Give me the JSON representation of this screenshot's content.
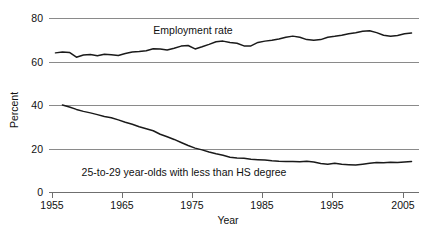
{
  "chart_data": {
    "type": "line",
    "title": "",
    "xlabel": "Year",
    "ylabel": "Percent",
    "xlim": [
      1954,
      2007
    ],
    "ylim": [
      0,
      84
    ],
    "grid": true,
    "legend_position": "inline-annotations",
    "xticks": [
      1955,
      1965,
      1975,
      1985,
      1995,
      2005
    ],
    "xticklabels": [
      "1955",
      "1965",
      "1975",
      "1985",
      "1995",
      "2005"
    ],
    "yticks": [
      0,
      20,
      40,
      60,
      80
    ],
    "yticklabels": [
      "0",
      "20",
      "40",
      "60",
      "80"
    ],
    "annotations": [
      {
        "text": "Employment rate",
        "x": 1982,
        "y": 78.5
      },
      {
        "text": "25-to-29 year-olds with less than HS degree",
        "x": 1984,
        "y": 8.5
      }
    ],
    "series": [
      {
        "name": "Employment rate",
        "color": "#1a1a1a",
        "x": [
          1955,
          1956,
          1957,
          1958,
          1959,
          1960,
          1961,
          1962,
          1963,
          1964,
          1965,
          1966,
          1967,
          1968,
          1969,
          1970,
          1971,
          1972,
          1973,
          1974,
          1975,
          1976,
          1977,
          1978,
          1979,
          1980,
          1981,
          1982,
          1983,
          1984,
          1985,
          1986,
          1987,
          1988,
          1989,
          1990,
          1991,
          1992,
          1993,
          1994,
          1995,
          1996,
          1997,
          1998,
          1999,
          2000,
          2001,
          2002,
          2003,
          2004,
          2005,
          2006
        ],
        "values": [
          64.2,
          64.6,
          64.4,
          62.2,
          63.2,
          63.4,
          62.9,
          63.6,
          63.3,
          63.0,
          63.9,
          64.6,
          64.8,
          65.2,
          66.1,
          66.0,
          65.5,
          66.3,
          67.3,
          67.6,
          66.0,
          67.0,
          68.1,
          69.3,
          69.6,
          69.0,
          68.6,
          67.4,
          67.4,
          69.0,
          69.6,
          70.0,
          70.6,
          71.4,
          71.9,
          71.4,
          70.3,
          70.0,
          70.3,
          71.4,
          71.8,
          72.3,
          73.0,
          73.4,
          74.1,
          74.4,
          73.5,
          72.3,
          71.8,
          72.2,
          73.0,
          73.3
        ],
        "values_note": "employment rate in percent; rescaled series as plotted spans roughly 62 to 76"
      },
      {
        "name": "25-to-29 year-olds with less than HS degree",
        "color": "#1a1a1a",
        "x": [
          1956,
          1957,
          1958,
          1959,
          1960,
          1961,
          1962,
          1963,
          1964,
          1965,
          1966,
          1967,
          1968,
          1969,
          1970,
          1971,
          1972,
          1973,
          1974,
          1975,
          1976,
          1977,
          1978,
          1979,
          1980,
          1981,
          1982,
          1983,
          1984,
          1985,
          1986,
          1987,
          1988,
          1989,
          1990,
          1991,
          1992,
          1993,
          1994,
          1995,
          1996,
          1997,
          1998,
          1999,
          2000,
          2001,
          2002,
          2003,
          2004,
          2005,
          2006
        ],
        "values": [
          40.2,
          39.3,
          38.2,
          37.3,
          36.6,
          35.8,
          34.9,
          34.4,
          33.4,
          32.3,
          31.4,
          30.2,
          29.3,
          28.4,
          26.8,
          25.6,
          24.4,
          23.0,
          21.6,
          20.4,
          19.6,
          18.6,
          17.8,
          17.1,
          16.2,
          15.9,
          15.7,
          15.3,
          15.1,
          14.9,
          14.6,
          14.4,
          14.3,
          14.2,
          14.1,
          14.4,
          14.0,
          13.3,
          13.0,
          13.4,
          13.0,
          12.8,
          12.6,
          13.0,
          13.4,
          13.8,
          13.7,
          13.9,
          13.8,
          14.0,
          14.2
        ]
      }
    ]
  }
}
